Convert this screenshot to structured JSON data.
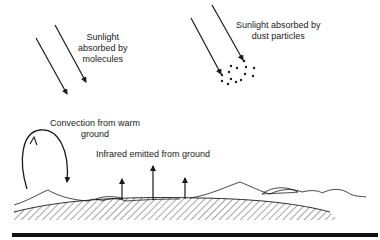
{
  "labels": {
    "molecules": [
      "Sunlight",
      "absorbed by",
      "molecules"
    ],
    "dust": [
      "Sunlight absorbed by",
      "dust particles"
    ],
    "convection": [
      "Convection from warm",
      "ground"
    ],
    "infrared": "Infrared emitted from ground"
  },
  "colors": {
    "ink": "#1a1a1a",
    "background": "#ffffff"
  }
}
